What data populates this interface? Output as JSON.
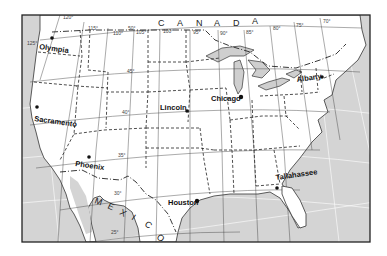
{
  "map": {
    "type": "political-outline",
    "region": "United States",
    "countries": [
      {
        "label_letters": [
          "C",
          "A",
          "N",
          "A",
          "D",
          "A"
        ],
        "name": "Canada"
      },
      {
        "label_letters": [
          "M",
          "E",
          "X",
          "I",
          "C",
          "O"
        ],
        "name": "Mexico"
      }
    ],
    "cities": [
      {
        "name": "Olympia",
        "x": 52,
        "y": 38,
        "label_x": 39,
        "label_y": 49
      },
      {
        "name": "Sacramento",
        "x": 37,
        "y": 107,
        "label_x": 34,
        "label_y": 121
      },
      {
        "name": "Phoenix",
        "x": 89,
        "y": 157,
        "label_x": 75,
        "label_y": 166
      },
      {
        "name": "Lincoln",
        "x": 187,
        "y": 111,
        "label_x": 160,
        "label_y": 110
      },
      {
        "name": "Chicago",
        "x": 241,
        "y": 97,
        "label_x": 211,
        "label_y": 101
      },
      {
        "name": "Albany",
        "x": 322,
        "y": 77,
        "label_x": 297,
        "label_y": 82
      },
      {
        "name": "Houston",
        "x": 197,
        "y": 201,
        "label_x": 168,
        "label_y": 205
      },
      {
        "name": "Tallahassee",
        "x": 277,
        "y": 188,
        "label_x": 276,
        "label_y": 180
      }
    ],
    "longitude_labels": [
      {
        "text": "125°",
        "x": 27,
        "y": 45
      },
      {
        "text": "120°",
        "x": 63,
        "y": 19
      },
      {
        "text": "115°",
        "x": 88,
        "y": 30
      },
      {
        "text": "110°",
        "x": 113,
        "y": 35
      },
      {
        "text": "105°",
        "x": 136,
        "y": 34
      },
      {
        "text": "100°",
        "x": 163,
        "y": 33
      },
      {
        "text": "95°",
        "x": 193,
        "y": 34
      },
      {
        "text": "90°",
        "x": 220,
        "y": 35
      },
      {
        "text": "85°",
        "x": 246,
        "y": 34
      },
      {
        "text": "80°",
        "x": 273,
        "y": 30
      },
      {
        "text": "75°",
        "x": 296,
        "y": 27
      },
      {
        "text": "70°",
        "x": 323,
        "y": 23
      }
    ],
    "latitude_labels": [
      {
        "text": "50°",
        "x": 128,
        "y": 30
      },
      {
        "text": "45°",
        "x": 127,
        "y": 73
      },
      {
        "text": "40°",
        "x": 122,
        "y": 114
      },
      {
        "text": "35°",
        "x": 118,
        "y": 157
      },
      {
        "text": "30°",
        "x": 114,
        "y": 195
      },
      {
        "text": "25°",
        "x": 111,
        "y": 234
      }
    ]
  },
  "colors": {
    "water": "#d4d4d4",
    "land": "#ffffff",
    "lines": "#222222"
  }
}
